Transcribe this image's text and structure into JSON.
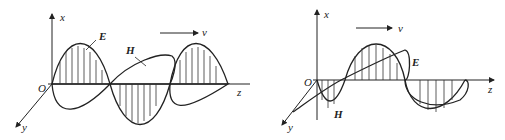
{
  "diagrams": [
    {
      "name": "em-wave-left",
      "axis_labels": {
        "x": "x",
        "y": "y",
        "z": "z",
        "origin": "O"
      },
      "field_labels": {
        "electric": "E",
        "magnetic": "H"
      },
      "velocity_label": "v"
    },
    {
      "name": "em-wave-right",
      "axis_labels": {
        "x": "x",
        "y": "y",
        "z": "z",
        "origin": "O"
      },
      "field_labels": {
        "electric": "E",
        "magnetic": "H"
      },
      "velocity_label": "v"
    }
  ]
}
